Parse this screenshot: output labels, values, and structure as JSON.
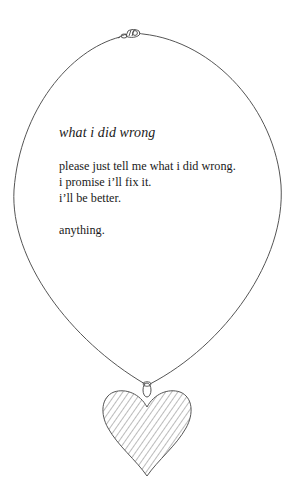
{
  "poem": {
    "title": "what i did wrong",
    "stanza1": [
      "please just tell me what i did wrong.",
      "i promise i’ll fix it.",
      "i’ll be better."
    ],
    "stanza2": [
      "anything."
    ]
  },
  "illustration": {
    "description": "necklace with heart pendant",
    "clasp_icon": "clasp-icon",
    "pendant_icon": "heart-pendant-icon",
    "line_color": "#555555",
    "hatch_color": "#777777",
    "background": "#ffffff"
  }
}
